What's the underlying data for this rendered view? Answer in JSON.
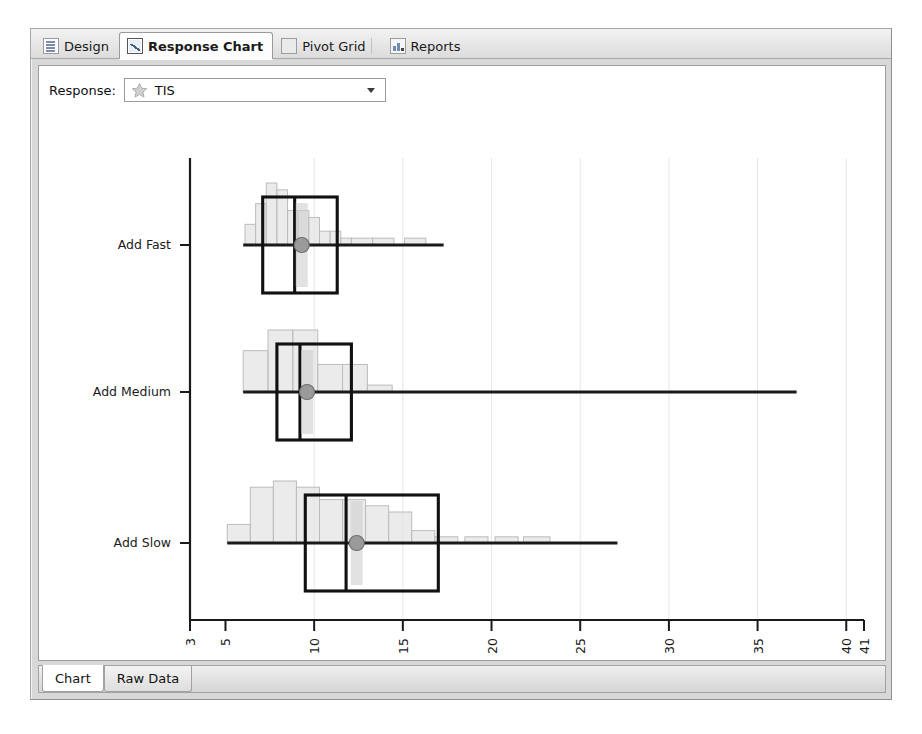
{
  "window": {
    "top_tabs": [
      {
        "label": "Design",
        "icon": "list-icon",
        "selected": false
      },
      {
        "label": "Response Chart",
        "icon": "line-chart-icon",
        "selected": true
      },
      {
        "label": "Pivot Grid",
        "icon": "grid-icon",
        "selected": false
      },
      {
        "label": "Reports",
        "icon": "report-icon",
        "selected": false
      }
    ],
    "bottom_tabs": [
      {
        "label": "Chart",
        "selected": true
      },
      {
        "label": "Raw Data",
        "selected": false
      }
    ]
  },
  "toolbar": {
    "response_label": "Response:",
    "response_value": "TIS",
    "response_icon": "star-icon",
    "dropdown_icon": "chevron-down-icon",
    "options": [
      "TIS"
    ]
  },
  "colors": {
    "axis": "#1a1a1a",
    "box_outline": "#111111",
    "histogram_fill": "#e3e3e3",
    "histogram_stroke": "#bcbcbc",
    "gridline": "#e6e6e6",
    "marker": "#9a9a9a",
    "whisker": "#1a1a1a",
    "panel_bg": "#ffffff",
    "frame_bg": "#d8d8d8"
  },
  "chart_data": {
    "type": "box",
    "title": "",
    "xlabel": "",
    "ylabel": "",
    "orientation": "horizontal",
    "xlim": [
      3,
      41
    ],
    "grid": true,
    "gridlines": [
      10,
      15,
      20,
      25,
      30,
      35,
      40
    ],
    "xticks": [
      3,
      5,
      10,
      15,
      20,
      25,
      30,
      35,
      40,
      41
    ],
    "xtick_labels": [
      "3",
      "5",
      "10",
      "15",
      "20",
      "25",
      "30",
      "35",
      "40",
      "41"
    ],
    "xtick_rotation": -90,
    "categories": [
      "Add Fast",
      "Add Medium",
      "Add Slow"
    ],
    "series": [
      {
        "name": "Add Fast",
        "min": 6.0,
        "q1": 7.1,
        "median": 8.9,
        "q3": 11.3,
        "max": 17.3,
        "mean": 9.3,
        "histogram": {
          "bin_width": 0.62,
          "bins": [
            {
              "x0": 6.1,
              "x1": 6.7,
              "count": 3
            },
            {
              "x0": 6.7,
              "x1": 7.3,
              "count": 6
            },
            {
              "x0": 7.3,
              "x1": 7.9,
              "count": 9
            },
            {
              "x0": 7.9,
              "x1": 8.5,
              "count": 8
            },
            {
              "x0": 8.5,
              "x1": 9.1,
              "count": 5
            },
            {
              "x0": 9.1,
              "x1": 9.7,
              "count": 5
            },
            {
              "x0": 9.7,
              "x1": 10.3,
              "count": 4
            },
            {
              "x0": 10.3,
              "x1": 10.9,
              "count": 2
            },
            {
              "x0": 10.9,
              "x1": 11.5,
              "count": 2
            },
            {
              "x0": 11.5,
              "x1": 12.1,
              "count": 1
            },
            {
              "x0": 12.1,
              "x1": 13.3,
              "count": 1
            },
            {
              "x0": 13.3,
              "x1": 14.5,
              "count": 1
            },
            {
              "x0": 15.1,
              "x1": 16.3,
              "count": 1
            }
          ]
        }
      },
      {
        "name": "Add Medium",
        "min": 6.0,
        "q1": 7.9,
        "median": 9.2,
        "q3": 12.1,
        "max": 37.2,
        "mean": 9.6,
        "histogram": {
          "bin_width": 1.2,
          "bins": [
            {
              "x0": 6.0,
              "x1": 7.4,
              "count": 6
            },
            {
              "x0": 7.4,
              "x1": 8.8,
              "count": 9
            },
            {
              "x0": 8.8,
              "x1": 10.2,
              "count": 9
            },
            {
              "x0": 10.2,
              "x1": 11.6,
              "count": 4
            },
            {
              "x0": 11.6,
              "x1": 13.0,
              "count": 4
            },
            {
              "x0": 13.0,
              "x1": 14.4,
              "count": 1
            }
          ]
        }
      },
      {
        "name": "Add Slow",
        "min": 5.1,
        "q1": 9.5,
        "median": 11.8,
        "q3": 17.0,
        "max": 27.1,
        "mean": 12.4,
        "histogram": {
          "bin_width": 1.25,
          "bins": [
            {
              "x0": 5.1,
              "x1": 6.4,
              "count": 3
            },
            {
              "x0": 6.4,
              "x1": 7.7,
              "count": 9
            },
            {
              "x0": 7.7,
              "x1": 9.0,
              "count": 10
            },
            {
              "x0": 9.0,
              "x1": 10.3,
              "count": 9
            },
            {
              "x0": 10.3,
              "x1": 11.6,
              "count": 7
            },
            {
              "x0": 11.6,
              "x1": 12.9,
              "count": 7
            },
            {
              "x0": 12.9,
              "x1": 14.2,
              "count": 6
            },
            {
              "x0": 14.2,
              "x1": 15.5,
              "count": 5
            },
            {
              "x0": 15.5,
              "x1": 16.8,
              "count": 2
            },
            {
              "x0": 16.8,
              "x1": 18.1,
              "count": 1
            },
            {
              "x0": 18.5,
              "x1": 19.8,
              "count": 1
            },
            {
              "x0": 20.2,
              "x1": 21.5,
              "count": 1
            },
            {
              "x0": 21.8,
              "x1": 23.3,
              "count": 1
            }
          ]
        }
      }
    ]
  }
}
